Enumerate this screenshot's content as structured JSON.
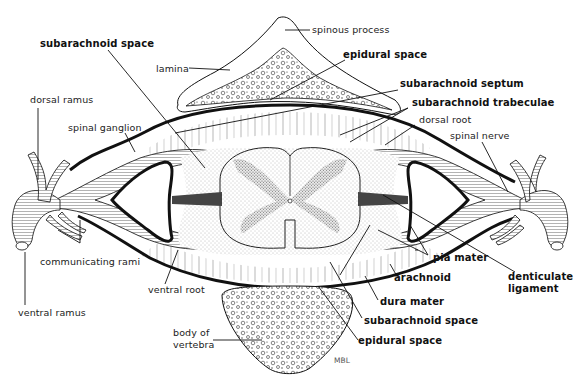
{
  "figure": {
    "credit": "MBL",
    "colors": {
      "ink": "#111111",
      "background": "#ffffff",
      "stipple": "#9a9a9a"
    }
  },
  "labels": {
    "spinous_process": "spinous process",
    "subarachnoid_space_top": "subarachnoid space",
    "epidural_space_top": "epidural space",
    "lamina": "lamina",
    "subarachnoid_septum": "subarachnoid septum",
    "subarachnoid_trabeculae": "subarachnoid trabeculae",
    "dorsal_ramus": "dorsal ramus",
    "dorsal_root": "dorsal root",
    "spinal_ganglion": "spinal ganglion",
    "spinal_nerve": "spinal nerve",
    "communicating_rami": "communicating rami",
    "pia_mater": "pia mater",
    "denticulate_ligament_1": "denticulate",
    "denticulate_ligament_2": "ligament",
    "ventral_root": "ventral root",
    "arachnoid": "arachnoid",
    "ventral_ramus": "ventral ramus",
    "dura_mater": "dura mater",
    "subarachnoid_space_bottom": "subarachnoid space",
    "body_of_vertebra_1": "body of",
    "body_of_vertebra_2": "vertebra",
    "epidural_space_bottom": "epidural space",
    "mbl": "MBL"
  }
}
